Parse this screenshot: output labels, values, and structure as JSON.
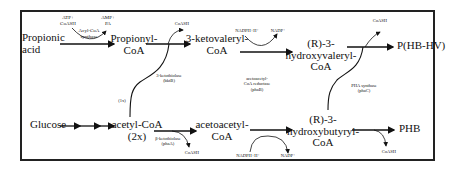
{
  "diagram": {
    "nodes": {
      "propionic_acid": "Propionic acid",
      "propionic_line1": "Propionic",
      "propionic_line2": "acid",
      "propionyl_coa_line1": "Propionyl-",
      "propionyl_coa_line2": "CoA",
      "ketovaleryl_line1": "3-ketovaleryl-",
      "ketovaleryl_line2": "CoA",
      "hydroxyvaleryl_line1": "(R)-3-",
      "hydroxyvaleryl_line2": "hydroxyvaleryl-",
      "hydroxyvaleryl_line3": "CoA",
      "phbhv": "P(HB-HV)",
      "glucose": "Glucose",
      "acetyl_coa_line1": "acetyl-CoA",
      "acetyl_coa_line2": "(2x)",
      "acetoacetyl_line1": "acetoacetyl-",
      "acetoacetyl_line2": "CoA",
      "hydroxybutyryl_line1": "(R)-3-",
      "hydroxybutyryl_line2": "hydroxybutyryl-",
      "hydroxybutyryl_line3": "CoA",
      "phb": "PHB"
    },
    "cofactors": {
      "atp_line1": "ATP+",
      "atp_line2": "CoASH",
      "amp_line1": "AMP+",
      "amp_line2": "PA",
      "coash_top1": "CoASH",
      "nadph_top": "NADPH+H⁺",
      "nadp_top": "NADP⁺",
      "coash_top2": "CoASH",
      "coash_bottom1": "CoASH",
      "nadph_bottom": "NADPH+H⁺",
      "nadp_bottom": "NADP⁺",
      "coash_bottom2": "CoASH"
    },
    "enzymes": {
      "acyl_coa_synthase_line1": "Acyl-CoA",
      "acyl_coa_synthase_line2": "synthase",
      "ketothiolase_bktb_line1": "3-ketothiolase",
      "ketothiolase_bktb_line2": "(bktB)",
      "reductase_line1": "acetoacetyl-",
      "reductase_line2": "CoA reductase",
      "reductase_line3": "(phaB)",
      "ketothiolase_phaa_line1": "β-ketothiolase",
      "ketothiolase_phaa_line2": "(phaA)",
      "pha_synthase_line1": "PHA synthase",
      "pha_synthase_line2": "(phaC)"
    },
    "annotations": {
      "one_x": "(1x)"
    }
  }
}
